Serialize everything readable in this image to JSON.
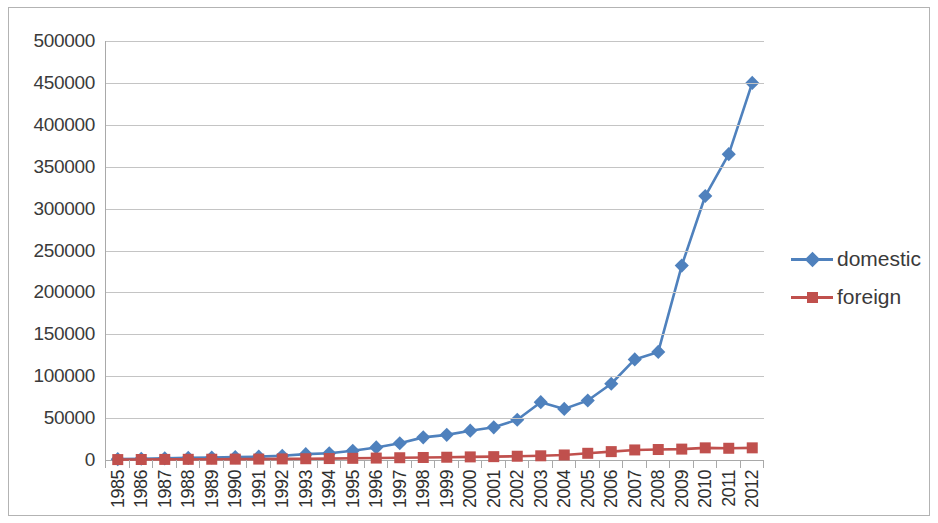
{
  "chart_data": {
    "type": "line",
    "title": "",
    "xlabel": "",
    "ylabel": "",
    "grid": true,
    "legend_position": "right",
    "ylim": [
      0,
      500000
    ],
    "ytick_step": 50000,
    "ytick_labels": [
      "500000",
      "450000",
      "400000",
      "350000",
      "300000",
      "250000",
      "200000",
      "150000",
      "100000",
      "50000",
      "0"
    ],
    "ytick_values": [
      500000,
      450000,
      400000,
      350000,
      300000,
      250000,
      200000,
      150000,
      100000,
      50000,
      0
    ],
    "categories": [
      "1985",
      "1986",
      "1987",
      "1988",
      "1989",
      "1990",
      "1991",
      "1992",
      "1993",
      "1994",
      "1995",
      "1996",
      "1997",
      "1998",
      "1999",
      "2000",
      "2001",
      "2002",
      "2003",
      "2004",
      "2005",
      "2006",
      "2007",
      "2008",
      "2009",
      "2010",
      "2011",
      "2012"
    ],
    "series": [
      {
        "name": "domestic",
        "color": "#4f81bd",
        "marker": "diamond",
        "values": [
          1000,
          1500,
          2000,
          2500,
          3000,
          3500,
          4000,
          5000,
          7000,
          8000,
          11000,
          15000,
          20000,
          27000,
          30000,
          35000,
          39000,
          48000,
          69000,
          61000,
          71000,
          91000,
          120000,
          129000,
          232000,
          315000,
          365000,
          450000
        ]
      },
      {
        "name": "foreign",
        "color": "#c0504d",
        "marker": "square",
        "values": [
          500,
          600,
          700,
          800,
          900,
          1000,
          1100,
          1300,
          1500,
          1700,
          2000,
          2300,
          2700,
          3000,
          3300,
          3700,
          4000,
          4500,
          5000,
          6000,
          8000,
          10000,
          12000,
          12500,
          13000,
          14500,
          14000,
          14500
        ]
      }
    ]
  },
  "legend": {
    "items": [
      {
        "label": "domestic",
        "color": "#4f81bd",
        "marker": "diamond"
      },
      {
        "label": "foreign",
        "color": "#c0504d",
        "marker": "square"
      }
    ]
  }
}
